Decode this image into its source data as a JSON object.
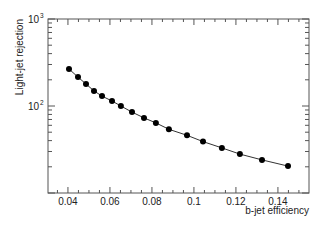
{
  "chart_data": {
    "type": "line",
    "title": "",
    "xlabel": "b-jet efficiency",
    "ylabel": "Light-jet rejection",
    "xlim": [
      0.0305,
      0.1548
    ],
    "ylim": [
      10,
      1000
    ],
    "yscale": "log",
    "grid": false,
    "legend": null,
    "x_ticks": [
      0.04,
      0.06,
      0.08,
      0.1,
      0.12,
      0.14
    ],
    "x_tick_labels": [
      "0.04",
      "0.06",
      "0.08",
      "0.1",
      "0.12",
      "0.14"
    ],
    "y_ticks": [
      100,
      1000
    ],
    "y_tick_labels": [
      {
        "base": "10",
        "exp": "2"
      },
      {
        "base": "10",
        "exp": "3"
      }
    ],
    "series": [
      {
        "name": "light-jet rejection vs b-jet efficiency",
        "marker": "circle",
        "color": "#000000",
        "x": [
          0.0405,
          0.0448,
          0.0486,
          0.0524,
          0.0562,
          0.061,
          0.0652,
          0.0705,
          0.0762,
          0.0819,
          0.0881,
          0.0967,
          0.1043,
          0.1133,
          0.1219,
          0.1324,
          0.1448
        ],
        "y": [
          266,
          215,
          179,
          149,
          130,
          114,
          100,
          85,
          73,
          64,
          54,
          46,
          39,
          33,
          28,
          24,
          20.4
        ]
      }
    ]
  },
  "colors": {
    "axis": "#555555",
    "line": "#333333",
    "marker": "#000000",
    "background": "#ffffff"
  }
}
